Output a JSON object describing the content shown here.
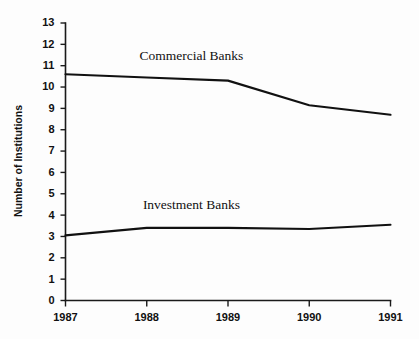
{
  "chart_data": {
    "type": "line",
    "title": "",
    "xlabel": "",
    "ylabel": "Number of Institutions",
    "categories": [
      "1987",
      "1988",
      "1989",
      "1990",
      "1991"
    ],
    "x": [
      1987,
      1988,
      1989,
      1990,
      1991
    ],
    "xlim": [
      1987,
      1991
    ],
    "ylim": [
      0,
      13
    ],
    "y_ticks": [
      0,
      1,
      2,
      3,
      4,
      5,
      6,
      7,
      8,
      9,
      10,
      11,
      12,
      13
    ],
    "y_tick_labels": [
      "0",
      "1",
      "2",
      "3",
      "4",
      "5",
      "6",
      "7",
      "8",
      "9",
      "10",
      "11",
      "12",
      "13"
    ],
    "x_tick_labels": [
      "1987",
      "1988",
      "1989",
      "1990",
      "1991"
    ],
    "grid": false,
    "legend_position": "inline-annotation",
    "series": [
      {
        "name": "Commercial Banks",
        "values": [
          10.6,
          10.45,
          10.3,
          9.15,
          8.7
        ],
        "color": "#111111",
        "label_x": 1988.55,
        "label_y": 11.25
      },
      {
        "name": "Investment Banks",
        "values": [
          3.05,
          3.4,
          3.4,
          3.35,
          3.55
        ],
        "color": "#111111",
        "label_x": 1988.55,
        "label_y": 4.3
      }
    ]
  },
  "axes": {
    "y_axis_title": "Number of Institutions"
  },
  "colors": {
    "background": "#fdfdfd",
    "axis": "#1a1a1a",
    "line": "#111111",
    "text": "#111111"
  }
}
